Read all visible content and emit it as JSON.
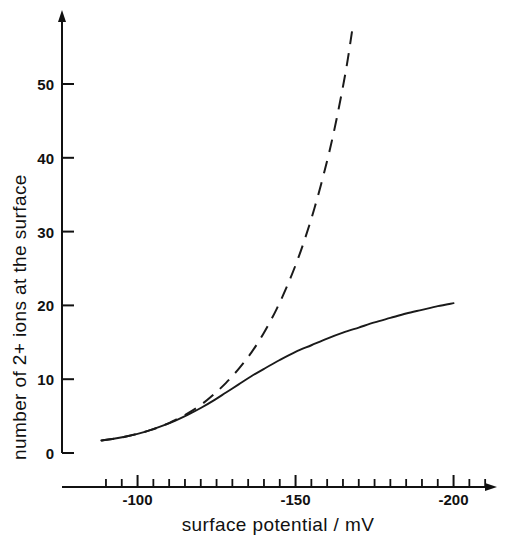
{
  "chart_data": {
    "type": "line",
    "title": "",
    "xlabel": "surface potential / mV",
    "ylabel": "number of 2+ ions at the surface",
    "xlim": [
      -84,
      -215
    ],
    "ylim": [
      0,
      58
    ],
    "grid": false,
    "legend": false,
    "x_ticks_major": [
      "-100",
      "-150",
      "-200"
    ],
    "x_tick_major_values": [
      -100,
      -150,
      -200
    ],
    "x_tick_minor_values": [
      -90,
      -95,
      -105,
      -110,
      -115,
      -120,
      -125,
      -130,
      -135,
      -140,
      -145,
      -155,
      -160,
      -165,
      -170,
      -175,
      -180,
      -185,
      -190,
      -195,
      -205,
      -210
    ],
    "y_ticks_major": [
      "0",
      "10",
      "20",
      "30",
      "40",
      "50"
    ],
    "y_tick_major_values": [
      0,
      10,
      20,
      30,
      40,
      50
    ],
    "series": [
      {
        "name": "solid-curve",
        "style": "solid",
        "color": "#1a1a1a",
        "x": [
          -88.5,
          -92,
          -96,
          -100,
          -104,
          -108,
          -112,
          -116,
          -120,
          -124,
          -128,
          -132,
          -136,
          -140,
          -145,
          -150,
          -155,
          -160,
          -165,
          -170,
          -175,
          -180,
          -185,
          -190,
          -195,
          -200
        ],
        "y": [
          1.7,
          1.9,
          2.2,
          2.6,
          3.1,
          3.7,
          4.4,
          5.2,
          6.1,
          7.1,
          8.2,
          9.3,
          10.4,
          11.4,
          12.6,
          13.7,
          14.6,
          15.5,
          16.3,
          17.0,
          17.7,
          18.3,
          18.9,
          19.4,
          19.9,
          20.3
        ]
      },
      {
        "name": "dashed-curve",
        "style": "dashed",
        "color": "#1a1a1a",
        "x": [
          -88.5,
          -92,
          -96,
          -100,
          -104,
          -108,
          -112,
          -116,
          -120,
          -124,
          -128,
          -132,
          -136,
          -140,
          -144,
          -148,
          -152,
          -156,
          -160,
          -163,
          -166,
          -168
        ],
        "y": [
          1.7,
          1.9,
          2.2,
          2.6,
          3.1,
          3.7,
          4.5,
          5.4,
          6.5,
          7.9,
          9.5,
          11.4,
          13.6,
          16.3,
          19.5,
          23.3,
          27.8,
          33.2,
          39.6,
          45.3,
          52.0,
          57.5
        ]
      }
    ]
  }
}
